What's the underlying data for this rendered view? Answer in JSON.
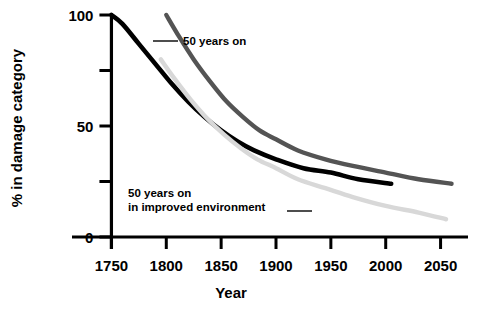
{
  "chart_data": {
    "type": "line",
    "title": "",
    "xlabel": "Year",
    "ylabel": "% in damage category",
    "xlim": [
      1725,
      2075
    ],
    "ylim": [
      0,
      100
    ],
    "grid": false,
    "legend_position": "inline-annotations",
    "x_ticks": [
      1750,
      1800,
      1850,
      1900,
      1950,
      2000,
      2050
    ],
    "x_tick_labels": [
      "1750",
      "1800",
      "1850",
      "1900",
      "1950",
      "2000",
      "2050"
    ],
    "y_ticks": [
      0,
      25,
      50,
      75,
      100
    ],
    "y_tick_labels": [
      "0",
      "",
      "50",
      "",
      "100"
    ],
    "series": [
      {
        "name": "baseline",
        "color": "#000000",
        "width": 4.6,
        "x": [
          1750,
          1760,
          1775,
          1790,
          1805,
          1820,
          1835,
          1850,
          1865,
          1880,
          1900,
          1925,
          1950,
          1975,
          2005
        ],
        "values": [
          100,
          96,
          87,
          78,
          69,
          61,
          54,
          48,
          43,
          39,
          35,
          31,
          29,
          26,
          24
        ]
      },
      {
        "name": "50 years on",
        "color": "#545454",
        "width": 4.4,
        "x": [
          1800,
          1812,
          1825,
          1840,
          1855,
          1870,
          1885,
          1900,
          1920,
          1945,
          1970,
          2000,
          2030,
          2060
        ],
        "values": [
          100,
          90,
          80,
          70,
          61,
          54,
          48,
          44,
          39,
          35,
          32,
          29,
          26,
          24
        ]
      },
      {
        "name": "50 years on in improved environment",
        "color": "#d8d8d8",
        "width": 4.4,
        "x": [
          1795,
          1808,
          1822,
          1838,
          1853,
          1868,
          1883,
          1900,
          1920,
          1945,
          1970,
          2000,
          2030,
          2055
        ],
        "values": [
          80,
          71,
          62,
          53,
          46,
          40,
          35,
          31,
          26,
          22,
          18,
          14,
          11,
          8
        ]
      }
    ],
    "annotations": [
      {
        "id": "annot-upper",
        "text_lines": [
          "50 years on"
        ],
        "text_x": 183,
        "text_y": 45,
        "leader": {
          "x1": 153,
          "y1": 41,
          "x2": 178,
          "y2": 41
        }
      },
      {
        "id": "annot-lower",
        "text_lines": [
          "50 years on",
          "in improved environment"
        ],
        "text_x": 128,
        "text_y": 197,
        "leader": {
          "x1": 287,
          "y1": 211,
          "x2": 312,
          "y2": 211
        }
      }
    ]
  },
  "axes": {
    "x_axis_label": "Year",
    "y_axis_label": "% in damage category",
    "axis_color": "#000000"
  }
}
